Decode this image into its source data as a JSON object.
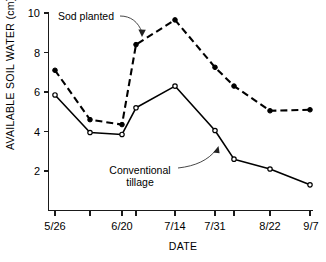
{
  "chart_data": {
    "type": "line",
    "title": "",
    "xlabel": "DATE",
    "ylabel": "AVAILABLE SOIL WATER (cm)",
    "ylim": [
      0,
      10
    ],
    "yticks": [
      2,
      4,
      6,
      8,
      10
    ],
    "ytick_labels": [
      "2",
      "4",
      "6",
      "8",
      "10"
    ],
    "grid": false,
    "legend_position": "none",
    "categories": [
      "5/26",
      "6/9",
      "6/20",
      "6/27",
      "7/14",
      "7/31",
      "8/5",
      "8/22",
      "9/7"
    ],
    "xtick_labels": [
      "5/26",
      "",
      "6/20",
      "",
      "7/14",
      "7/31",
      "",
      "8/22",
      "9/7"
    ],
    "xtick_label_visible": [
      "5/26",
      "6/20",
      "7/14",
      "7/31",
      "8/22",
      "9/7"
    ],
    "series": [
      {
        "name": "Sod planted",
        "style": "dashed",
        "marker": "filled-square",
        "values": [
          7.1,
          4.6,
          4.35,
          8.4,
          9.65,
          7.25,
          6.3,
          5.05,
          5.1
        ]
      },
      {
        "name": "Conventional tillage",
        "style": "solid",
        "marker": "open-circle",
        "values": [
          5.85,
          3.95,
          3.85,
          5.2,
          6.3,
          4.05,
          2.6,
          2.1,
          1.3
        ]
      }
    ],
    "annotations": [
      {
        "id": "sod-planted",
        "text": "Sod planted",
        "lines": [
          "Sod planted"
        ]
      },
      {
        "id": "conventional-tillage",
        "text": "Conventional tillage",
        "lines": [
          "Conventional",
          "tillage"
        ]
      }
    ],
    "colors": {
      "line": "#000000",
      "axis": "#1a1a1a",
      "background": "#ffffff",
      "leader": "#333333"
    }
  }
}
